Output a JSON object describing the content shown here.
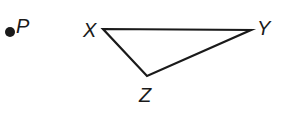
{
  "figure": {
    "background_color": "#ffffff",
    "stroke_color": "#1a1a1a",
    "stroke_width": 2.2,
    "width": 284,
    "height": 113
  },
  "labels": {
    "point_p": "P",
    "vertex_x": "X",
    "vertex_y": "Y",
    "vertex_z": "Z"
  },
  "geometry": {
    "point_p": {
      "cx": 10,
      "cy": 32,
      "r": 5,
      "name": "P"
    },
    "triangle": {
      "name": "XYZ",
      "vertices": [
        {
          "name": "X",
          "x": 103,
          "y": 29
        },
        {
          "name": "Y",
          "x": 251,
          "y": 30
        },
        {
          "name": "Z",
          "x": 147,
          "y": 76
        }
      ],
      "edges": [
        "XY",
        "YZ",
        "ZX"
      ]
    }
  }
}
